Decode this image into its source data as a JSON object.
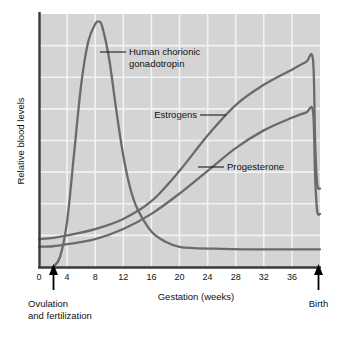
{
  "chart_data": {
    "type": "line",
    "title": "",
    "xlabel": "Gestation (weeks)",
    "ylabel": "Relative blood levels",
    "xlim": [
      0,
      40
    ],
    "ylim": [
      0,
      100
    ],
    "grid": true,
    "legend_position": "inline-annotations",
    "xticks": [
      0,
      4,
      8,
      12,
      16,
      20,
      24,
      28,
      32,
      36
    ],
    "xtick_labels": [
      "0",
      "4",
      "8",
      "12",
      "16",
      "20",
      "24",
      "28",
      "32",
      "36"
    ],
    "yticks": [],
    "ytick_labels": [],
    "annotations": [
      {
        "text": "Ovulation\nand fertilization",
        "x": 2,
        "marker": "up-arrow",
        "position": "below-axis-left"
      },
      {
        "text": "Birth",
        "x": 39.5,
        "marker": "up-arrow",
        "position": "below-axis-right"
      }
    ],
    "series": [
      {
        "name": "Human chorionic gonadotropin",
        "label_text": "Human chorionic\ngonadotropin",
        "color": "#6a6a6a",
        "x": [
          2,
          3,
          4,
          5,
          6,
          7,
          8,
          8.5,
          9,
          10,
          11,
          12,
          13,
          14,
          16,
          18,
          20,
          22,
          26,
          30,
          34,
          38,
          40
        ],
        "values": [
          0,
          4,
          18,
          45,
          72,
          89,
          96,
          97,
          95,
          82,
          62,
          44,
          31,
          23,
          14,
          10,
          8,
          7.5,
          7.2,
          7,
          7,
          7,
          7
        ]
      },
      {
        "name": "Estrogens",
        "label_text": "Estrogens",
        "color": "#6a6a6a",
        "x": [
          0,
          2,
          4,
          8,
          12,
          16,
          20,
          24,
          28,
          32,
          36,
          38,
          39,
          39.3,
          39.6,
          40
        ],
        "values": [
          11,
          11.5,
          12.5,
          15,
          19,
          26,
          38,
          52,
          64,
          72,
          78,
          81,
          82,
          50,
          33,
          31
        ]
      },
      {
        "name": "Progesterone",
        "label_text": "Progesterone",
        "color": "#6a6a6a",
        "x": [
          0,
          2,
          4,
          8,
          12,
          16,
          20,
          24,
          28,
          32,
          36,
          38,
          39,
          39.3,
          39.6,
          40
        ],
        "values": [
          8,
          8.2,
          9,
          11,
          15,
          21,
          29,
          38,
          47,
          54,
          59,
          61,
          61.5,
          36,
          22,
          21
        ]
      }
    ]
  },
  "figure": {
    "plot_background": "#d4d4d4",
    "gridline_color": "#f2f2f2",
    "axis_color": "#3a3a3a",
    "curve_color": "#6a6a6a"
  }
}
